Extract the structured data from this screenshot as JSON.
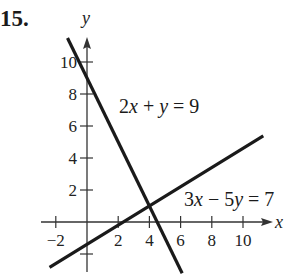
{
  "problem": {
    "number": "15."
  },
  "chart_data": {
    "type": "line",
    "title": "",
    "xlabel": "x",
    "ylabel": "y",
    "xlim": [
      -3,
      11.5
    ],
    "ylim": [
      -3,
      11.5
    ],
    "grid": false,
    "x_ticks": [
      -2,
      2,
      4,
      6,
      8,
      10
    ],
    "y_ticks": [
      2,
      4,
      6,
      8,
      10
    ],
    "x_tick_labels": [
      "−2",
      "2",
      "4",
      "6",
      "8",
      "10"
    ],
    "y_tick_labels": [
      "2",
      "4",
      "6",
      "8",
      "10"
    ],
    "series": [
      {
        "name": "2x + y = 9",
        "equation": "2x + y = 9",
        "slope": -2,
        "intercept": 9,
        "x": [
          -1.25,
          6.1
        ],
        "y": [
          11.5,
          -3.2
        ],
        "color": "#1a1a1a"
      },
      {
        "name": "3x − 5y = 7",
        "equation": "3x - 5y = 7",
        "slope": 0.6,
        "intercept": -1.4,
        "x": [
          -2.4,
          11.3
        ],
        "y": [
          -2.84,
          5.38
        ],
        "color": "#1a1a1a"
      }
    ],
    "annotations": [
      {
        "text": "2x + y = 9",
        "x": 2.1,
        "y": 6.9
      },
      {
        "text": "3x − 5y = 7",
        "x": 6.3,
        "y": 1.1
      }
    ],
    "intersection": {
      "x": 4,
      "y": 1
    }
  },
  "labels": {
    "x_axis": "x",
    "y_axis": "y",
    "eq1_parts": [
      "2",
      "x",
      " + ",
      "y",
      " = 9"
    ],
    "eq2_parts": [
      "3",
      "x",
      " − 5",
      "y",
      " = 7"
    ]
  }
}
